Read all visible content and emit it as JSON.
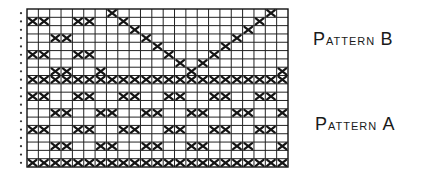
{
  "chart_data": {
    "type": "grid-pattern",
    "title": "",
    "columns": 23,
    "rows": 19,
    "cell_mark": "X",
    "row_marker": "dot",
    "patterns": [
      {
        "name": "Pattern B",
        "rows": [
          1,
          2,
          3,
          4,
          5,
          6,
          7,
          8,
          9
        ]
      },
      {
        "name": "Pattern A",
        "rows": [
          9,
          10,
          11,
          12,
          13,
          14,
          15,
          16,
          17,
          18,
          19
        ]
      }
    ],
    "marked_cells_by_row": [
      {
        "row": 1,
        "cols": [
          8,
          22
        ]
      },
      {
        "row": 2,
        "cols": [
          1,
          2,
          5,
          6,
          9,
          21
        ]
      },
      {
        "row": 3,
        "cols": [
          10,
          20
        ]
      },
      {
        "row": 4,
        "cols": [
          3,
          4,
          11,
          19
        ]
      },
      {
        "row": 5,
        "cols": [
          12,
          18
        ]
      },
      {
        "row": 6,
        "cols": [
          1,
          2,
          5,
          6,
          13,
          17
        ]
      },
      {
        "row": 7,
        "cols": [
          14,
          16
        ]
      },
      {
        "row": 8,
        "cols": [
          3,
          4,
          7,
          15,
          23
        ]
      },
      {
        "row": 9,
        "cols": [
          1,
          2,
          3,
          4,
          5,
          6,
          7,
          8,
          9,
          10,
          11,
          12,
          13,
          14,
          15,
          16,
          17,
          18,
          19,
          20,
          21,
          22,
          23
        ]
      },
      {
        "row": 10,
        "cols": []
      },
      {
        "row": 11,
        "cols": [
          1,
          2,
          5,
          6,
          9,
          10,
          13,
          14,
          17,
          18,
          21,
          22
        ]
      },
      {
        "row": 12,
        "cols": []
      },
      {
        "row": 13,
        "cols": [
          3,
          4,
          7,
          8,
          11,
          12,
          15,
          16,
          19,
          20,
          23
        ]
      },
      {
        "row": 14,
        "cols": []
      },
      {
        "row": 15,
        "cols": [
          1,
          2,
          5,
          6,
          9,
          10,
          13,
          14,
          17,
          18,
          21,
          22
        ]
      },
      {
        "row": 16,
        "cols": []
      },
      {
        "row": 17,
        "cols": [
          3,
          4,
          7,
          8,
          11,
          12,
          15,
          16,
          19,
          20,
          23
        ]
      },
      {
        "row": 18,
        "cols": []
      },
      {
        "row": 19,
        "cols": [
          1,
          2,
          3,
          4,
          5,
          6,
          7,
          8,
          9,
          10,
          11,
          12,
          13,
          14,
          15,
          16,
          17,
          18,
          19,
          20,
          21,
          22,
          23
        ]
      }
    ]
  },
  "labels": {
    "pattern_b": {
      "first": "P",
      "rest": "ATTERN",
      "letter": "B"
    },
    "pattern_a": {
      "first": "P",
      "rest": "ATTERN",
      "letter": "A"
    }
  }
}
